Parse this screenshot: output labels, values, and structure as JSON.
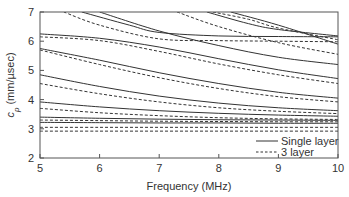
{
  "chart_data": {
    "type": "line",
    "title": "",
    "xlabel": "Frequency (MHz)",
    "ylabel": "c_p (mm/µsec)",
    "ylabel_main": "c",
    "ylabel_sub": "p",
    "ylabel_units": " (mm/µsec)",
    "xlim": [
      5,
      10
    ],
    "ylim": [
      2,
      7
    ],
    "xticks": [
      "5",
      "6",
      "7",
      "8",
      "9",
      "10"
    ],
    "yticks": [
      "2",
      "3",
      "4",
      "5",
      "6",
      "7"
    ],
    "grid": false,
    "legend_position": "lower right",
    "legend": [
      {
        "label": "Single layer",
        "style": "solid"
      },
      {
        "label": "3 layer",
        "style": "dashed"
      }
    ],
    "series": [
      {
        "name": "Single layer",
        "style": "solid",
        "curves": [
          {
            "x": [
              5,
              6,
              7,
              8,
              9,
              10
            ],
            "y": [
              3.4,
              3.36,
              3.33,
              3.31,
              3.3,
              3.29
            ]
          },
          {
            "x": [
              5,
              6,
              7,
              8,
              9,
              10
            ],
            "y": [
              3.22,
              3.21,
              3.2,
              3.2,
              3.19,
              3.19
            ]
          },
          {
            "x": [
              5,
              6,
              7,
              8,
              9,
              10
            ],
            "y": [
              3.92,
              3.75,
              3.62,
              3.53,
              3.47,
              3.43
            ]
          },
          {
            "x": [
              5,
              6,
              7,
              8,
              9,
              10
            ],
            "y": [
              4.85,
              4.45,
              4.12,
              3.88,
              3.72,
              3.62
            ]
          },
          {
            "x": [
              5,
              6,
              7,
              8,
              9,
              10
            ],
            "y": [
              5.75,
              5.35,
              4.92,
              4.55,
              4.25,
              4.05
            ]
          },
          {
            "x": [
              5,
              6,
              7,
              8,
              9,
              10
            ],
            "y": [
              6.25,
              6.1,
              5.8,
              5.4,
              5.02,
              4.72
            ]
          },
          {
            "x": [
              5.7,
              6.5,
              7,
              8,
              9,
              10
            ],
            "y": [
              7.0,
              6.55,
              6.3,
              6.18,
              6.16,
              6.15
            ]
          },
          {
            "x": [
              6.0,
              7,
              8,
              9,
              10
            ],
            "y": [
              7.0,
              6.35,
              5.85,
              5.45,
              5.2
            ]
          },
          {
            "x": [
              7.8,
              8.5,
              9,
              10
            ],
            "y": [
              7.0,
              6.6,
              6.4,
              6.18
            ]
          },
          {
            "x": [
              8.2,
              9,
              10
            ],
            "y": [
              7.0,
              6.55,
              5.9
            ]
          }
        ]
      },
      {
        "name": "3 layer",
        "style": "dashed",
        "curves": [
          {
            "x": [
              5,
              6,
              7,
              8,
              9,
              10
            ],
            "y": [
              3.3,
              3.28,
              3.26,
              3.25,
              3.24,
              3.24
            ]
          },
          {
            "x": [
              5,
              6,
              7,
              8,
              9,
              10
            ],
            "y": [
              3.05,
              3.05,
              3.05,
              3.05,
              3.05,
              3.05
            ]
          },
          {
            "x": [
              5,
              6,
              7,
              8,
              9,
              10
            ],
            "y": [
              2.92,
              2.92,
              2.92,
              2.92,
              2.92,
              2.92
            ]
          },
          {
            "x": [
              5,
              6,
              7,
              8,
              9,
              10
            ],
            "y": [
              3.7,
              3.55,
              3.45,
              3.38,
              3.34,
              3.32
            ]
          },
          {
            "x": [
              5,
              6,
              7,
              8,
              9,
              10
            ],
            "y": [
              4.55,
              4.2,
              3.92,
              3.72,
              3.6,
              3.52
            ]
          },
          {
            "x": [
              5,
              6,
              7,
              8,
              9,
              10
            ],
            "y": [
              5.7,
              5.2,
              4.75,
              4.38,
              4.1,
              3.92
            ]
          },
          {
            "x": [
              5,
              6,
              7,
              8,
              9,
              10
            ],
            "y": [
              6.15,
              6.02,
              5.65,
              5.22,
              4.85,
              4.55
            ]
          },
          {
            "x": [
              5.4,
              6,
              7,
              8,
              9,
              10
            ],
            "y": [
              7.0,
              6.55,
              6.08,
              6.02,
              6.0,
              5.98
            ]
          },
          {
            "x": [
              7.3,
              8,
              9,
              10
            ],
            "y": [
              7.0,
              6.5,
              5.95,
              5.55
            ]
          },
          {
            "x": [
              7.9,
              8.5,
              9,
              10
            ],
            "y": [
              7.0,
              6.75,
              6.45,
              6.05
            ]
          }
        ]
      }
    ]
  }
}
